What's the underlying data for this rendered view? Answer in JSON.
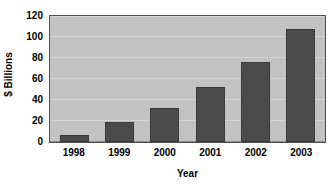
{
  "chart_data": {
    "type": "bar",
    "title": "",
    "categories": [
      "1998",
      "1999",
      "2000",
      "2001",
      "2002",
      "2003"
    ],
    "values": [
      7,
      19,
      32,
      52,
      76,
      108
    ],
    "series": [
      {
        "name": "$ Billions",
        "values": [
          7,
          19,
          32,
          52,
          76,
          108
        ]
      }
    ],
    "xlabel": "Year",
    "ylabel": "$ Billions",
    "ylim": [
      0,
      120
    ],
    "yticks": [
      0,
      20,
      40,
      60,
      80,
      100,
      120
    ],
    "ytick_labels": [
      "0",
      "20",
      "40",
      "60",
      "80",
      "100",
      "120"
    ],
    "grid": true,
    "grid_axis": "y",
    "legend": false,
    "legend_position": "none",
    "bar_color": "#4b4b4b",
    "bar_border_color": "#3a3a3a",
    "plot_background": "#c2c2c2",
    "gridline_color": "#d2d2d2",
    "axis_border_color": "#4d4d4d",
    "figure_background": "#ffffff",
    "text_color": "#000000"
  }
}
